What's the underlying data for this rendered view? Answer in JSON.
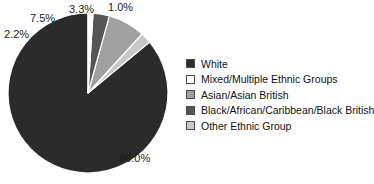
{
  "chart_data": {
    "type": "pie",
    "title": "",
    "xlabel": "",
    "ylabel": "",
    "legend_position": "right",
    "grid": false,
    "categories": [
      "White",
      "Mixed/Multiple Ethnic Groups",
      "Asian/Asian British",
      "Black/African/Caribbean/Black British",
      "Other Ethnic Group"
    ],
    "values": [
      86.0,
      1.0,
      7.5,
      3.3,
      2.2
    ],
    "value_labels": [
      "86.0%",
      "1.0%",
      "7.5%",
      "3.3%",
      "2.2%"
    ],
    "colors": [
      "#2b2b2b",
      "#ffffff",
      "#a0a0a0",
      "#555555",
      "#c8c8c8"
    ],
    "slices": [
      {
        "label": "White",
        "value": 86.0,
        "display": "86.0%",
        "color": "#2b2b2b"
      },
      {
        "label": "Other Ethnic Group",
        "value": 2.2,
        "display": "2.2%",
        "color": "#c8c8c8"
      },
      {
        "label": "Asian/Asian British",
        "value": 7.5,
        "display": "7.5%",
        "color": "#a0a0a0"
      },
      {
        "label": "Black/African/Caribbean/Black British",
        "value": 3.3,
        "display": "3.3%",
        "color": "#555555"
      },
      {
        "label": "Mixed/Multiple Ethnic Groups",
        "value": 1.0,
        "display": "1.0%",
        "color": "#ffffff"
      }
    ]
  },
  "legend": {
    "items": [
      {
        "label": "White",
        "color": "#2b2b2b"
      },
      {
        "label": "Mixed/Multiple Ethnic Groups",
        "color": "#ffffff"
      },
      {
        "label": "Asian/Asian British",
        "color": "#a0a0a0"
      },
      {
        "label": "Black/African/Caribbean/Black British",
        "color": "#555555"
      },
      {
        "label": "Other Ethnic Group",
        "color": "#c8c8c8"
      }
    ]
  }
}
